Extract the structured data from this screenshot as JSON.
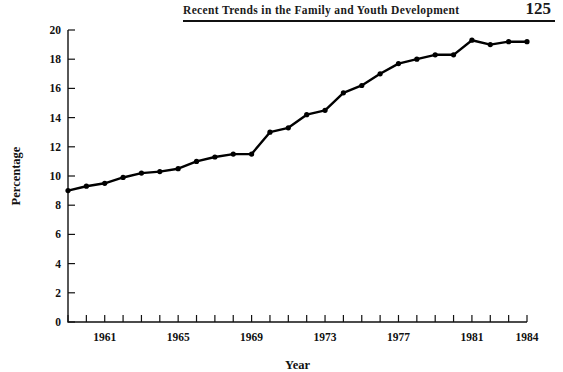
{
  "header": {
    "title": "Recent Trends in the Family and Youth Development",
    "page_number": "125"
  },
  "chart_data": {
    "type": "line",
    "title": "",
    "xlabel": "Year",
    "ylabel": "Percentage",
    "xlim": [
      1959,
      1984
    ],
    "ylim": [
      0,
      20
    ],
    "ytick_values": [
      0,
      2,
      4,
      6,
      8,
      10,
      12,
      14,
      16,
      18,
      20
    ],
    "ytick_labels": [
      "0",
      "2",
      "4",
      "6",
      "8",
      "10",
      "12",
      "14",
      "16",
      "18",
      "20"
    ],
    "xtick_values": [
      1959,
      1960,
      1961,
      1962,
      1963,
      1964,
      1965,
      1966,
      1967,
      1968,
      1969,
      1970,
      1971,
      1972,
      1973,
      1974,
      1975,
      1976,
      1977,
      1978,
      1979,
      1980,
      1981,
      1982,
      1983,
      1984
    ],
    "xtick_labels": [
      "1961",
      "1965",
      "1969",
      "1973",
      "1977",
      "1981",
      "1984"
    ],
    "xtick_labeled_values": [
      1961,
      1965,
      1969,
      1973,
      1977,
      1981,
      1984
    ],
    "grid": false,
    "legend": null,
    "marker": "filled-circle",
    "line_color": "#000000",
    "x": [
      1959,
      1960,
      1961,
      1962,
      1963,
      1964,
      1965,
      1966,
      1967,
      1968,
      1969,
      1970,
      1971,
      1972,
      1973,
      1974,
      1975,
      1976,
      1977,
      1978,
      1979,
      1980,
      1981,
      1982,
      1983,
      1984
    ],
    "values": [
      9.0,
      9.3,
      9.5,
      9.9,
      10.2,
      10.3,
      10.5,
      11.0,
      11.3,
      11.5,
      11.5,
      13.0,
      13.3,
      14.2,
      14.5,
      15.7,
      16.2,
      17.0,
      17.7,
      18.0,
      18.3,
      18.3,
      19.3,
      19.0,
      19.2,
      19.2
    ]
  }
}
